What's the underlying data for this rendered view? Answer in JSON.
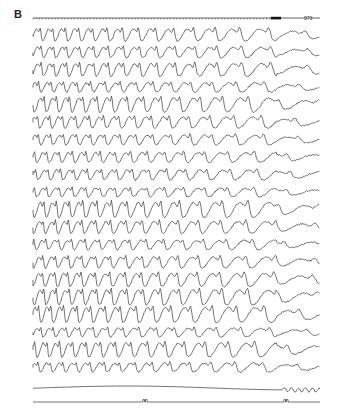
{
  "figure": {
    "panel_label": "B",
    "timebar_label": "973",
    "colors": {
      "trace": "#3a3a3a",
      "background": "#ffffff",
      "label": "#222222"
    },
    "layout": {
      "x_start": 33,
      "x_end": 320,
      "timebar_y": 18,
      "channel_top_y": 35,
      "channel_spacing": 17.5,
      "eeg_channel_count": 20,
      "slow_trace_y": 388,
      "marker_trace_y": 402
    },
    "marker_pulses_x": [
      143,
      284
    ],
    "caption_note": "caption text cropped at bottom edge"
  }
}
